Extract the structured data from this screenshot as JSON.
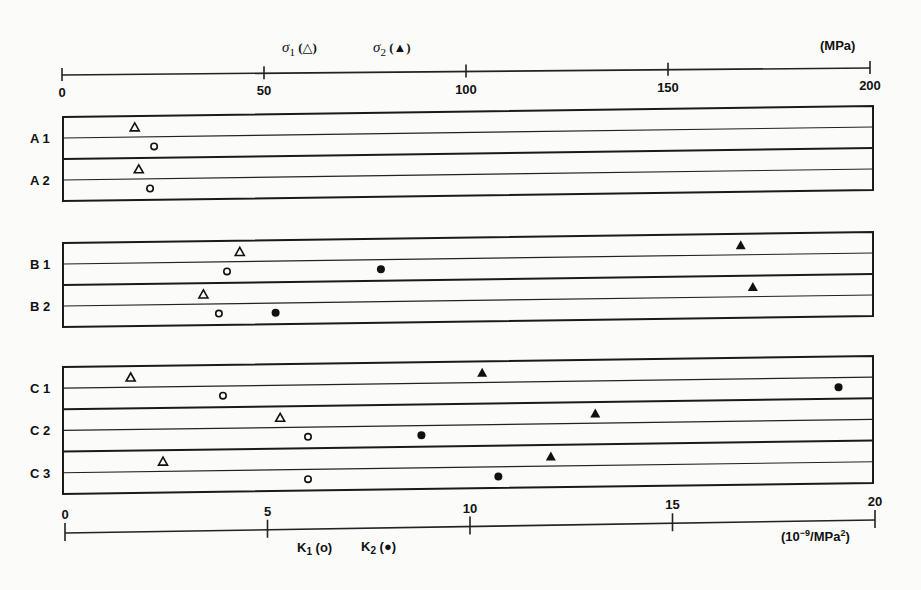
{
  "chart_data": {
    "type": "scatter",
    "title": "",
    "top_axis": {
      "label_sigma1": "σ1 (△)",
      "label_sigma2": "σ2 (▲)",
      "unit": "(MPa)",
      "range": [
        0,
        200
      ],
      "ticks": [
        0,
        50,
        100,
        150,
        200
      ],
      "tick_labels": [
        "0",
        "50",
        "100",
        "150",
        "200"
      ]
    },
    "bottom_axis": {
      "label_k1": "K1 (o)",
      "label_k2": "K2 (●)",
      "unit": "(10⁻⁹/MPa²)",
      "range": [
        0,
        20
      ],
      "ticks": [
        0,
        5,
        10,
        15,
        20
      ],
      "tick_labels": [
        "0",
        "5",
        "10",
        "15",
        "20"
      ]
    },
    "groups": [
      {
        "name": "A",
        "rows": [
          {
            "label": "A1",
            "sigma1": 18,
            "sigma2": null,
            "K1": 2.2,
            "K2": null
          },
          {
            "label": "A2",
            "sigma1": 19,
            "sigma2": null,
            "K1": 2.1,
            "K2": null
          }
        ]
      },
      {
        "name": "B",
        "rows": [
          {
            "label": "B1",
            "sigma1": 44,
            "sigma2": 168,
            "K1": 4.0,
            "K2": 7.8
          },
          {
            "label": "B2",
            "sigma1": 35,
            "sigma2": 171,
            "K1": 3.8,
            "K2": 5.2
          }
        ]
      },
      {
        "name": "C",
        "rows": [
          {
            "label": "C1",
            "sigma1": 17,
            "sigma2": 104,
            "K1": 3.9,
            "K2": 19.1
          },
          {
            "label": "C2",
            "sigma1": 54,
            "sigma2": 132,
            "K1": 6.0,
            "K2": 8.8
          },
          {
            "label": "C3",
            "sigma1": 25,
            "sigma2": 121,
            "K1": 6.0,
            "K2": 10.7
          }
        ]
      }
    ],
    "legend": {
      "open_triangle": "σ1",
      "filled_triangle": "σ2",
      "open_circle": "K1",
      "filled_circle": "K2"
    },
    "grid": false
  }
}
